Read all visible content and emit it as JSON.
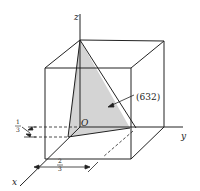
{
  "figure": {
    "axes": {
      "x": "x",
      "y": "y",
      "z": "z"
    },
    "origin_label": "O",
    "plane_label": "(632)",
    "intercept_x": {
      "num": "2",
      "den": "3"
    },
    "intercept_z": {
      "num": "1",
      "den": "3"
    },
    "colors": {
      "line": "#222222",
      "plane_fill": "#d4d4d4",
      "background": "#ffffff"
    }
  }
}
